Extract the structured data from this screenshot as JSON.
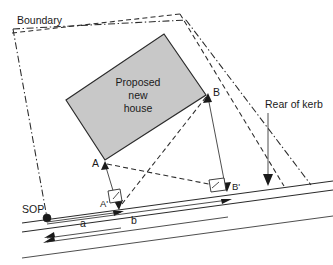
{
  "diagram": {
    "type": "survey-site-plan",
    "colors": {
      "house_fill": "#c8c8c8",
      "line": "#2b2b2b",
      "background": "#ffffff"
    },
    "labels": {
      "boundary": "Boundary",
      "house_line1": "Proposed",
      "house_line2": "new",
      "house_line3": "house",
      "rear_of_kerb": "Rear of kerb",
      "point_a": "A",
      "point_a_prime": "A'",
      "point_b": "B",
      "point_b_prime": "B'",
      "sop": "SOP",
      "dim_a": "a",
      "dim_b": "b"
    },
    "geometry": {
      "house_corners": "(66,100) (164,34) (206,95) (105,160)",
      "point_a": "(105,162)",
      "point_a_prime": "(118,205)",
      "point_b": "(208,94)",
      "point_b_prime": "(226,188)",
      "sop_point": "(47,218)",
      "kerb_line": "from (22,223) to (333,181)"
    }
  }
}
